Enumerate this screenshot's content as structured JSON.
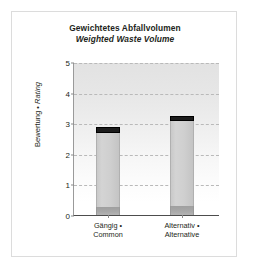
{
  "chart_data": {
    "type": "bar",
    "title": "Gewichtetes Abfallvolumen",
    "subtitle": "Weighted Waste Volume",
    "xlabel": "",
    "ylabel": "Bewertung • Rating",
    "ylabel_de": "Bewertung",
    "ylabel_separator": " • ",
    "ylabel_en": "Rating",
    "ylim": [
      0,
      5
    ],
    "yticks": [
      0,
      1,
      2,
      3,
      4,
      5
    ],
    "ytick_labels": [
      "0",
      "1",
      "2",
      "3",
      "4",
      "5"
    ],
    "grid": "horizontal-dashed",
    "legend": "none",
    "stacked": true,
    "categories": [
      {
        "line1": "Gängig •",
        "line2": "Common",
        "full": "Gängig • Common"
      },
      {
        "line1": "Alternativ •",
        "line2": "Alternative",
        "full": "Alternativ • Alternative"
      }
    ],
    "series": [
      {
        "name": "base-segment",
        "color": "#a8a8a8",
        "values": [
          0.26,
          0.29
        ]
      },
      {
        "name": "body-segment",
        "color": "#cfcfcf",
        "values": [
          2.42,
          2.77
        ]
      },
      {
        "name": "cap-segment",
        "color": "#1c1c1c",
        "values": [
          0.19,
          0.19
        ]
      }
    ],
    "totals": [
      2.87,
      3.25
    ]
  },
  "style": {
    "card_border": "#dcdcdc",
    "axis_color": "#4d4d4d",
    "grid_color": "#b9b9b9",
    "text_color": "#231f20",
    "plot_bg_top": "#e2e2e2",
    "plot_bg_bottom": "#ffffff"
  }
}
